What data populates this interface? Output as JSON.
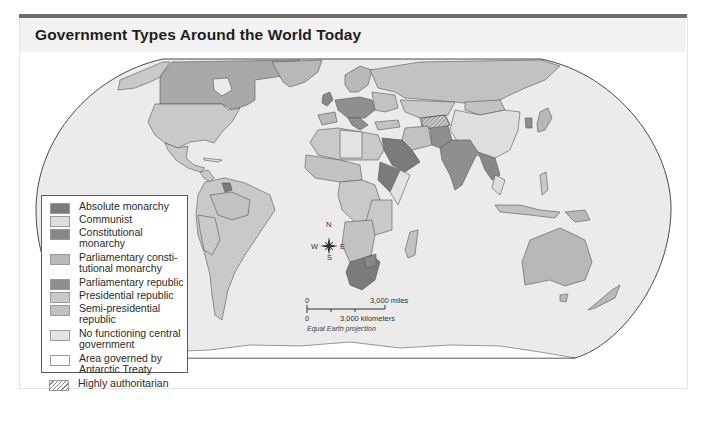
{
  "title": "Government Types Around the World Today",
  "legend": {
    "items": [
      {
        "label": "Absolute monarchy",
        "color": "#7b7b7b"
      },
      {
        "label": "Communist",
        "color": "#dedede"
      },
      {
        "label": "Constitutional monarchy",
        "color": "#888888"
      },
      {
        "label": "Parliamentary consti-tutional monarchy",
        "color": "#b8b8b8"
      },
      {
        "label": "Parliamentary republic",
        "color": "#8f8f8f"
      },
      {
        "label": "Presidential republic",
        "color": "#c9c9c9"
      },
      {
        "label": "Semi-presidential republic",
        "color": "#c2c2c2"
      },
      {
        "label": "No functioning central government",
        "color": "#e3e3e3"
      },
      {
        "label": "Area governed by Antarctic Treaty",
        "color": "#ffffff"
      },
      {
        "label": "Highly authoritarian",
        "color": "hatch"
      }
    ]
  },
  "compass": {
    "n": "N",
    "s": "S",
    "e": "E",
    "w": "W"
  },
  "scale": {
    "miles_zero": "0",
    "miles_label": "3,000 miles",
    "km_zero": "0",
    "km_label": "3,000 kilometers"
  },
  "projection": "Equal Earth projection",
  "colors": {
    "ocean": "#ebebeb",
    "border": "#4a4a4a",
    "frame_bar": "#6e6e6e",
    "title_bg": "#f2f2f2"
  }
}
